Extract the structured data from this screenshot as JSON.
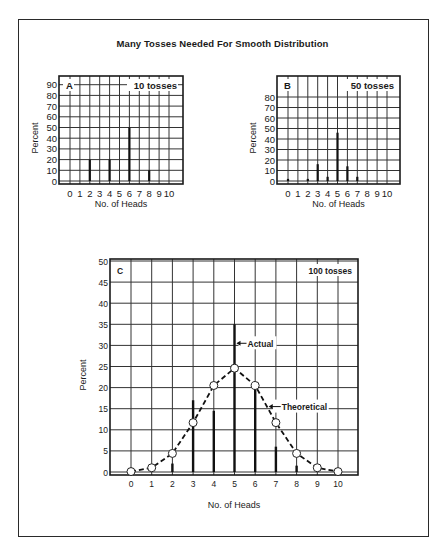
{
  "title": "Many Tosses Needed For Smooth Distribution",
  "chart_data": [
    {
      "type": "bar",
      "panel": "A",
      "annotation": "10 tosses",
      "xlabel": "No. of Heads",
      "ylabel": "Percent",
      "categories": [
        "0",
        "1",
        "2",
        "3",
        "4",
        "5",
        "6",
        "7",
        "8",
        "9",
        "10"
      ],
      "values": [
        0,
        0,
        20,
        0,
        20,
        0,
        50,
        0,
        10,
        0,
        0
      ],
      "yticks": [
        0,
        10,
        20,
        30,
        40,
        50,
        60,
        70,
        80,
        90
      ],
      "ylim": [
        0,
        100
      ],
      "grid": true
    },
    {
      "type": "bar",
      "panel": "B",
      "annotation": "50 tosses",
      "xlabel": "No. of Heads",
      "ylabel": "Percent",
      "categories": [
        "0",
        "1",
        "2",
        "3",
        "4",
        "5",
        "6",
        "7",
        "8",
        "9",
        "10"
      ],
      "values": [
        2,
        0,
        2,
        16,
        4,
        46,
        14,
        4,
        0,
        0,
        0
      ],
      "yticks": [
        0,
        10,
        20,
        30,
        40,
        50,
        60,
        70,
        80
      ],
      "ylim": [
        0,
        90
      ],
      "grid": true
    },
    {
      "type": "bar",
      "panel": "C",
      "annotation": "100 tosses",
      "xlabel": "No. of Heads",
      "ylabel": "Percent",
      "categories": [
        "0",
        "1",
        "2",
        "3",
        "4",
        "5",
        "6",
        "7",
        "8",
        "9",
        "10"
      ],
      "series": [
        {
          "name": "Actual",
          "type": "bar",
          "values": [
            1,
            0,
            2,
            17,
            14.5,
            35,
            20,
            6,
            1.5,
            1,
            0
          ]
        },
        {
          "name": "Theoretical",
          "type": "line",
          "style": "dashed",
          "marker": "open-circle",
          "values": [
            0.1,
            1.0,
            4.4,
            11.7,
            20.5,
            24.6,
            20.5,
            11.7,
            4.4,
            1.0,
            0.1
          ]
        }
      ],
      "labels": {
        "actual": "Actual",
        "theoretical": "Theoretical"
      },
      "yticks": [
        0,
        5,
        10,
        15,
        20,
        25,
        30,
        35,
        40,
        45,
        50
      ],
      "ylim": [
        0,
        50
      ],
      "grid": true
    }
  ]
}
